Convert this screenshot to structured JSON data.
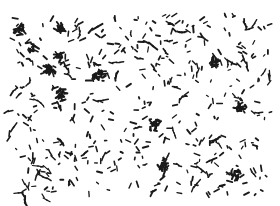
{
  "image": {
    "description": "Micrograph of scattered dark rod- and chain-shaped particles (bacteria-like) on a white background",
    "background_color": "#ffffff",
    "particle_color": "#1a1a1a",
    "field_bounds": {
      "x0": 10,
      "y0": 14,
      "x1": 272,
      "y1": 196
    },
    "particle_count_estimate": 420,
    "clusters": [
      {
        "x": 20,
        "y": 30
      },
      {
        "x": 33,
        "y": 46
      },
      {
        "x": 60,
        "y": 28
      },
      {
        "x": 60,
        "y": 58
      },
      {
        "x": 50,
        "y": 70
      },
      {
        "x": 62,
        "y": 95
      },
      {
        "x": 100,
        "y": 74
      },
      {
        "x": 155,
        "y": 125
      },
      {
        "x": 163,
        "y": 165
      },
      {
        "x": 215,
        "y": 62
      },
      {
        "x": 235,
        "y": 175
      },
      {
        "x": 240,
        "y": 108
      }
    ]
  }
}
